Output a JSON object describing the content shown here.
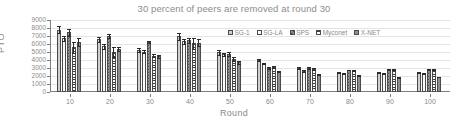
{
  "chart_data": {
    "type": "bar",
    "title": "30 percent of peers are removed at round 30",
    "xlabel": "Round",
    "ylabel": "PTO",
    "categories": [
      "10",
      "20",
      "30",
      "40",
      "50",
      "60",
      "70",
      "80",
      "90",
      "100"
    ],
    "ylim": [
      0,
      9000
    ],
    "yticks": [
      "0",
      "1000",
      "2000",
      "3000",
      "4000",
      "5000",
      "6000",
      "7000",
      "8000",
      "9000"
    ],
    "grid": true,
    "legend_position": "upper right inside plot",
    "series": [
      {
        "name": "SG-1",
        "color": "#cfcfcf",
        "pattern": "solid-light-gray",
        "values": [
          7800,
          6600,
          5250,
          6950,
          4950,
          3950,
          3000,
          2400,
          2400,
          2380
        ],
        "errors": [
          450,
          300,
          220,
          420,
          280,
          120,
          100,
          70,
          60,
          60
        ]
      },
      {
        "name": "SG-LA",
        "color": "#fbfbfb",
        "pattern": "solid-white",
        "values": [
          6700,
          5700,
          5050,
          6350,
          4700,
          3550,
          2600,
          2350,
          2300,
          2300
        ],
        "errors": [
          320,
          340,
          180,
          330,
          230,
          110,
          90,
          60,
          60,
          60
        ]
      },
      {
        "name": "SPS",
        "color": "#9a9a9a",
        "pattern": "checkerboard-dark",
        "values": [
          7450,
          7050,
          6250,
          6450,
          4700,
          2950,
          3000,
          2750,
          2800,
          2800
        ],
        "errors": [
          400,
          260,
          180,
          330,
          250,
          130,
          90,
          50,
          50,
          50
        ]
      },
      {
        "name": "Myconet",
        "color": "#ffffff",
        "pattern": "horizontal-stripes",
        "values": [
          5600,
          4950,
          4550,
          6100,
          4100,
          3100,
          2850,
          2700,
          2800,
          2780
        ],
        "errors": [
          700,
          620,
          230,
          700,
          260,
          160,
          110,
          60,
          50,
          50
        ]
      },
      {
        "name": "X-NET",
        "color": "#8e8e8e",
        "pattern": "solid-dark-gray",
        "values": [
          6250,
          5350,
          4450,
          6150,
          3700,
          2550,
          2150,
          2100,
          1850,
          1870
        ],
        "errors": [
          500,
          260,
          200,
          420,
          230,
          110,
          80,
          50,
          50,
          50
        ]
      }
    ]
  }
}
